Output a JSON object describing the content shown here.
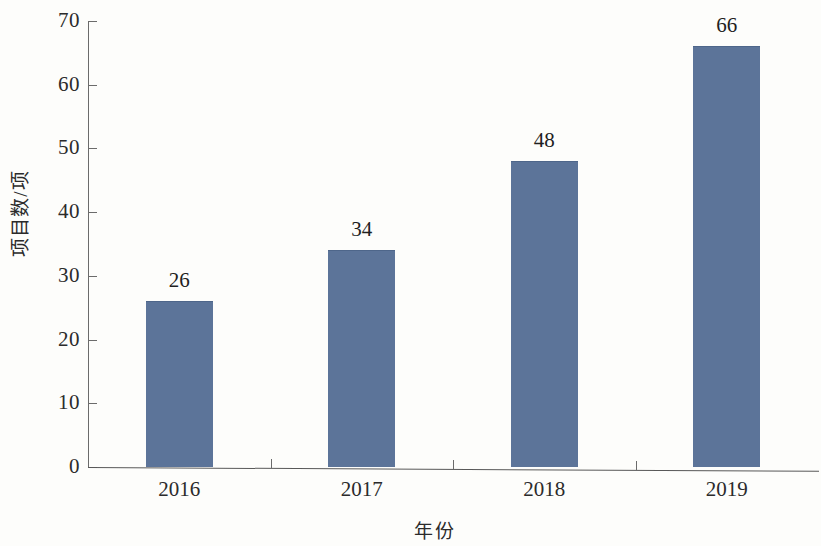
{
  "chart_data": {
    "type": "bar",
    "title": "",
    "xlabel": "年份",
    "ylabel": "项目数/项",
    "categories": [
      "2016",
      "2017",
      "2018",
      "2019"
    ],
    "values": [
      26,
      34,
      48,
      66
    ],
    "value_labels": [
      "26",
      "34",
      "48",
      "66"
    ],
    "ylim": [
      0,
      70
    ],
    "ytick_labels": [
      "0",
      "10",
      "20",
      "30",
      "40",
      "50",
      "60",
      "70"
    ],
    "ytick_values": [
      0,
      10,
      20,
      30,
      40,
      50,
      60,
      70
    ],
    "grid": false,
    "legend": false,
    "series_color": "#5c7499",
    "axis_color": "#6b6b6b",
    "text_color": "#2b2b2b",
    "background_color": "#fdfdfb"
  }
}
